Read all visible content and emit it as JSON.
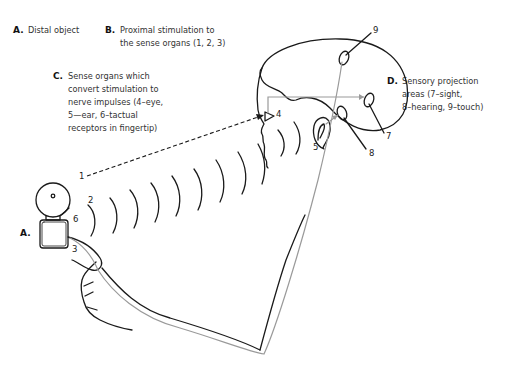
{
  "labels": {
    "a": {
      "letter": "A.",
      "text": "Distal object"
    },
    "b": {
      "letter": "B.",
      "line1": "Proximal stimulation to",
      "line2": "the sense organs (1, 2, 3)"
    },
    "c": {
      "letter": "C.",
      "line1": "Sense organs which",
      "line2": "convert stimulation to",
      "line3": "nerve impulses (4–eye,",
      "line4": "5—ear, 6–tactual",
      "line5": "receptors in fingertip)"
    },
    "d": {
      "letter": "D.",
      "line1": "Sensory projection",
      "line2": "areas (7–sight,",
      "line3": "8–hearing, 9–touch)"
    },
    "a_object": {
      "letter": "A."
    }
  },
  "numbers": {
    "n1": "1",
    "n2": "2",
    "n3": "3",
    "n4": "4",
    "n5": "5",
    "n6": "6",
    "n7": "7",
    "n8": "8",
    "n9": "9"
  },
  "colors": {
    "ink": "#1a1a1a",
    "nerve": "#9a9a9a",
    "background": "#ffffff"
  }
}
